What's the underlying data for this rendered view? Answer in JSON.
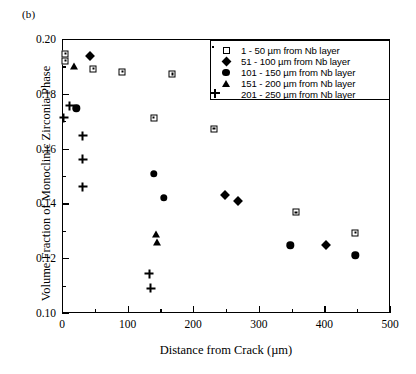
{
  "figure": {
    "panel_label": "(b)"
  },
  "chart_data": {
    "type": "scatter",
    "title": "",
    "xlabel": "Distance from Crack (µm)",
    "ylabel": "Volume Fraction of Monoclinic Zirconia Phase",
    "xlim": [
      0,
      500
    ],
    "ylim": [
      0.1,
      0.2
    ],
    "xticks": [
      0,
      100,
      200,
      300,
      400,
      500
    ],
    "xtick_labels": [
      "0",
      "100",
      "200",
      "300",
      "400",
      "500"
    ],
    "x_minor_ticks": [
      50,
      150,
      250,
      350,
      450
    ],
    "yticks": [
      0.1,
      0.12,
      0.14,
      0.16,
      0.18,
      0.2
    ],
    "ytick_labels": [
      "0.10",
      "0.12",
      "0.14",
      "0.16",
      "0.18",
      "0.20"
    ],
    "y_minor_ticks": [
      0.11,
      0.13,
      0.15,
      0.17,
      0.19
    ],
    "grid": false,
    "legend_position": "top-right",
    "series": [
      {
        "name": "1 - 50 µm from Nb layer",
        "marker": "open-square-dot",
        "points": [
          {
            "x": 5,
            "y": 0.1947
          },
          {
            "x": 5,
            "y": 0.1921
          },
          {
            "x": 48,
            "y": 0.1892
          },
          {
            "x": 92,
            "y": 0.1881
          },
          {
            "x": 140,
            "y": 0.1712
          },
          {
            "x": 168,
            "y": 0.1872
          },
          {
            "x": 232,
            "y": 0.1673
          },
          {
            "x": 357,
            "y": 0.1367
          },
          {
            "x": 447,
            "y": 0.1293
          }
        ]
      },
      {
        "name": "51 - 100 µm from Nb layer",
        "marker": "filled-diamond",
        "points": [
          {
            "x": 42,
            "y": 0.1937
          },
          {
            "x": 248,
            "y": 0.1432
          },
          {
            "x": 268,
            "y": 0.1408
          },
          {
            "x": 402,
            "y": 0.1247
          }
        ]
      },
      {
        "name": "101 - 150 µm from Nb layer",
        "marker": "filled-circle",
        "points": [
          {
            "x": 22,
            "y": 0.1747
          },
          {
            "x": 140,
            "y": 0.1508
          },
          {
            "x": 155,
            "y": 0.142
          },
          {
            "x": 348,
            "y": 0.1247
          },
          {
            "x": 447,
            "y": 0.1211
          }
        ]
      },
      {
        "name": "151 - 200 µm from Nb layer",
        "marker": "filled-triangle",
        "points": [
          {
            "x": 18,
            "y": 0.19
          },
          {
            "x": 143,
            "y": 0.1287
          },
          {
            "x": 145,
            "y": 0.1258
          }
        ]
      },
      {
        "name": "201 - 250 µm from Nb layer",
        "marker": "plus",
        "points": [
          {
            "x": 3,
            "y": 0.1712
          },
          {
            "x": 12,
            "y": 0.179
          },
          {
            "x": 32,
            "y": 0.1712
          },
          {
            "x": 32,
            "y": 0.1659
          },
          {
            "x": 32,
            "y": 0.1592
          },
          {
            "x": 133,
            "y": 0.1307
          },
          {
            "x": 135,
            "y": 0.1287
          }
        ]
      }
    ]
  }
}
